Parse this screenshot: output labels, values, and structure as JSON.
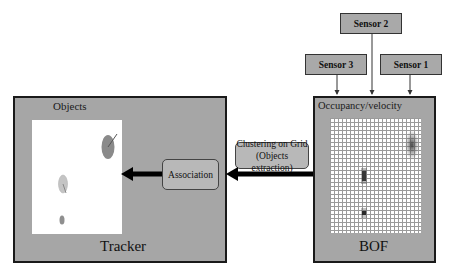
{
  "sensors": [
    {
      "label": "Sensor 2"
    },
    {
      "label": "Sensor 3"
    },
    {
      "label": "Sensor 1"
    }
  ],
  "tracker": {
    "title": "Objects",
    "label": "Tracker"
  },
  "bof": {
    "title": "Occupancy/velocity",
    "label": "BOF"
  },
  "process": {
    "clustering_line1": "Clustering on Grid",
    "clustering_line2": "(Objects extraction)",
    "association": "Association"
  },
  "colors": {
    "box_fill": "#a6a6a6",
    "border": "#1a1a1a",
    "arrow": "#000000",
    "ellipse_dark": "#8a8a8a",
    "ellipse_light": "#c4c4c4"
  }
}
